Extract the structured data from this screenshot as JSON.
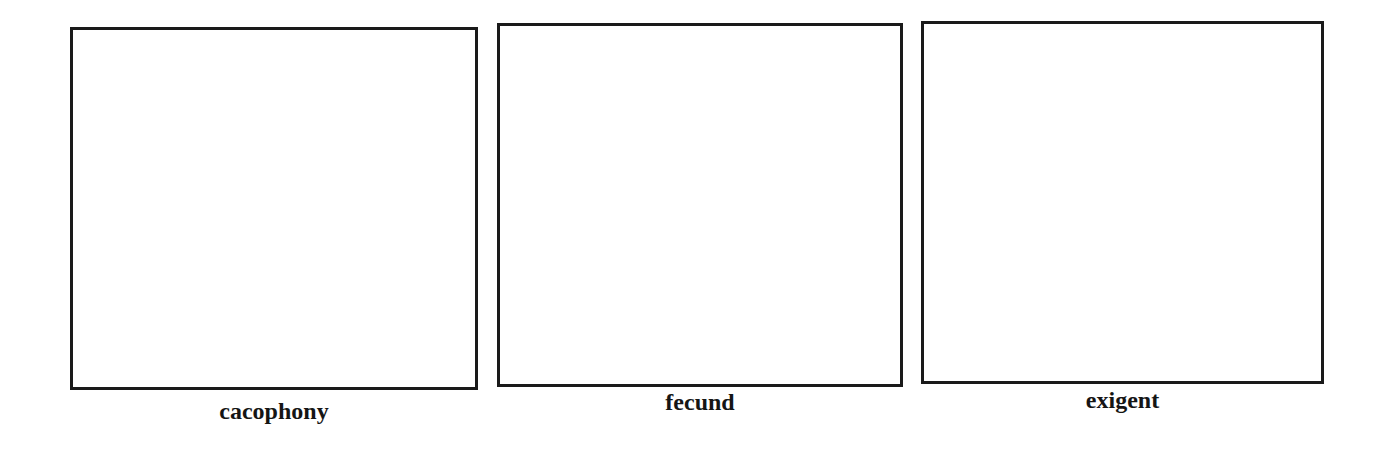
{
  "panels": [
    {
      "label": "cacophony"
    },
    {
      "label": "fecund"
    },
    {
      "label": "exigent"
    }
  ],
  "colors": {
    "border": "#1a1a1a",
    "background": "#ffffff",
    "text": "#151515"
  }
}
